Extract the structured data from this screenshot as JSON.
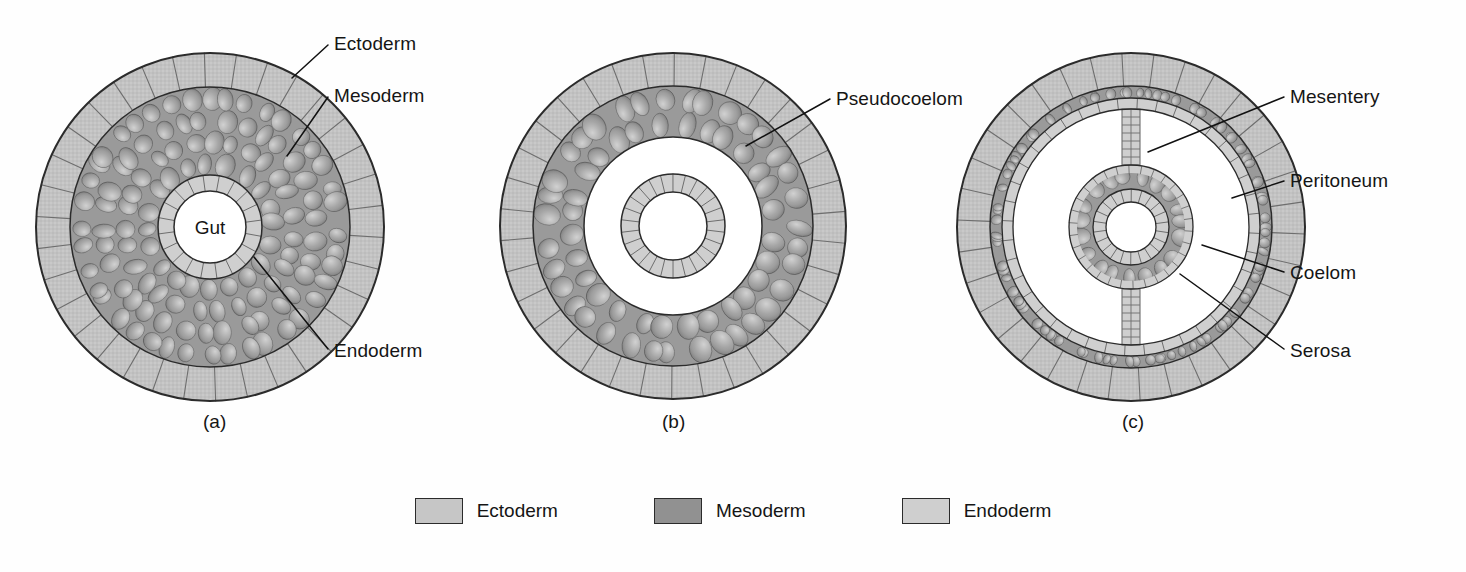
{
  "figure": {
    "background": "#ffffff"
  },
  "colors": {
    "ectoderm": "#c2c2c2",
    "mesoderm": "#9a9a9a",
    "endoderm": "#cfcfcf",
    "cavity": "#ffffff",
    "outline": "#2b2b2b",
    "cell_line": "#6e6e6e",
    "leader": "#111111",
    "text": "#151515"
  },
  "panels": [
    {
      "id": "a",
      "caption": "(a)",
      "caption_x": 203,
      "caption_y": 411,
      "center_x": 210,
      "center_y": 227,
      "radii": {
        "body_outer": 174,
        "ectoderm_inner": 140,
        "mesoderm_inner": 52,
        "endoderm_inner": 36
      },
      "type": "acoelomate",
      "cavity_label": "Gut",
      "labels": [
        {
          "name": "ectoderm",
          "text": "Ectoderm",
          "x": 334,
          "y": 33,
          "leader": [
            [
              328,
              45
            ],
            [
              292,
              78
            ]
          ]
        },
        {
          "name": "mesoderm",
          "text": "Mesoderm",
          "x": 334,
          "y": 85,
          "leader": [
            [
              328,
              97
            ],
            [
              287,
              156
            ]
          ]
        },
        {
          "name": "endoderm",
          "text": "Endoderm",
          "x": 334,
          "y": 340,
          "leader": [
            [
              328,
              349
            ],
            [
              254,
              257
            ]
          ]
        }
      ]
    },
    {
      "id": "b",
      "caption": "(b)",
      "caption_x": 662,
      "caption_y": 411,
      "center_x": 673,
      "center_y": 226,
      "radii": {
        "body_outer": 173,
        "ectoderm_inner": 140,
        "mesoderm_inner": 89,
        "endoderm_outer": 52,
        "endoderm_inner": 34
      },
      "type": "pseudocoelomate",
      "labels": [
        {
          "name": "pseudocoelom",
          "text": "Pseudocoelom",
          "x": 836,
          "y": 88,
          "leader": [
            [
              830,
              99
            ],
            [
              746,
              146
            ]
          ]
        }
      ]
    },
    {
      "id": "c",
      "caption": "(c)",
      "caption_x": 1122,
      "caption_y": 411,
      "center_x": 1131,
      "center_y": 227,
      "radii": {
        "body_outer": 174,
        "ectoderm_inner": 141,
        "peritoneum_outer": 129,
        "coelom_outer": 118,
        "gut_mesoderm_outer": 62,
        "endoderm_outer": 38,
        "endoderm_inner": 25
      },
      "type": "eucoelomate",
      "mesentery_half_width": 9,
      "labels": [
        {
          "name": "mesentery",
          "text": "Mesentery",
          "x": 1290,
          "y": 86,
          "leader": [
            [
              1284,
              97
            ],
            [
              1148,
              152
            ]
          ]
        },
        {
          "name": "peritoneum",
          "text": "Peritoneum",
          "x": 1290,
          "y": 170,
          "leader": [
            [
              1284,
              181
            ],
            [
              1232,
              198
            ]
          ]
        },
        {
          "name": "coelom",
          "text": "Coelom",
          "x": 1290,
          "y": 262,
          "leader": [
            [
              1284,
              272
            ],
            [
              1202,
              245
            ]
          ]
        },
        {
          "name": "serosa",
          "text": "Serosa",
          "x": 1290,
          "y": 340,
          "leader": [
            [
              1284,
              349
            ],
            [
              1180,
              274
            ]
          ]
        }
      ]
    }
  ],
  "legend": {
    "items": [
      {
        "name": "ectoderm",
        "label": "Ectoderm",
        "color": "#c6c6c6"
      },
      {
        "name": "mesoderm",
        "label": "Mesoderm",
        "color": "#919191"
      },
      {
        "name": "endoderm",
        "label": "Endoderm",
        "color": "#cfcfcf"
      }
    ]
  }
}
